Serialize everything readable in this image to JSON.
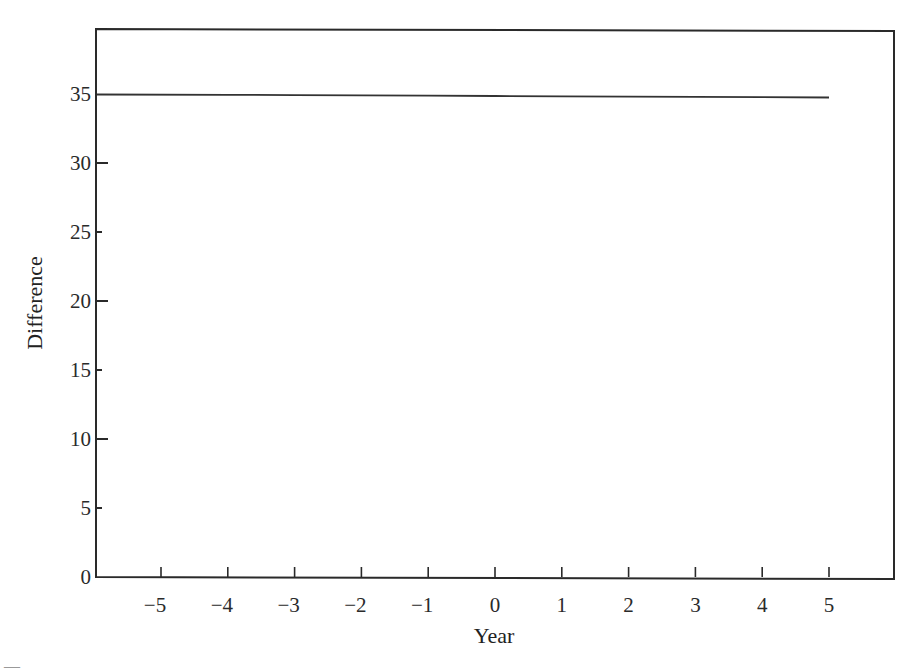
{
  "chart_data": {
    "type": "line",
    "title": "",
    "xlabel": "Year",
    "ylabel": "Difference",
    "x": [
      -5,
      -4,
      -3,
      -2,
      -1,
      0,
      1,
      2,
      3,
      4,
      5
    ],
    "series": [
      {
        "name": "Difference",
        "values": [
          35,
          35,
          35,
          35,
          35,
          35,
          35,
          35,
          35,
          35,
          35
        ]
      }
    ],
    "x_ticks": [
      "−5",
      "−4",
      "−3",
      "−2",
      "−1",
      "0",
      "1",
      "2",
      "3",
      "4",
      "5"
    ],
    "y_ticks": [
      "0",
      "5",
      "10",
      "15",
      "20",
      "25",
      "30",
      "35"
    ],
    "xlim": [
      -6,
      6
    ],
    "ylim": [
      0,
      40
    ],
    "grid": false,
    "legend": null,
    "colors": {
      "line": "#333333",
      "frame": "#222222",
      "background": "#ffffff"
    }
  }
}
